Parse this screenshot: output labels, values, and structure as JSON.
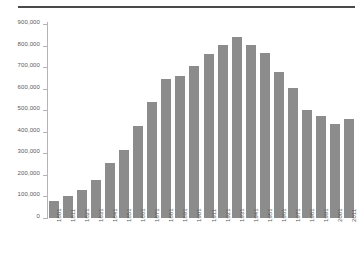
{
  "chart_data": {
    "type": "bar",
    "title": "",
    "subtitle": "",
    "xlabel": "",
    "ylabel": "",
    "grid": false,
    "legend": "none",
    "ylim": [
      0,
      900000
    ],
    "ytick_labels": [
      "900,000",
      "800,000",
      "700,000",
      "600,000",
      "500,000",
      "400,000",
      "300,000",
      "200,000",
      "100,000",
      "0"
    ],
    "ytick_values": [
      900000,
      800000,
      700000,
      600000,
      500000,
      400000,
      300000,
      200000,
      100000,
      0
    ],
    "categories": [
      "1801",
      "1811",
      "1821",
      "1831",
      "1841",
      "1851",
      "1861",
      "1871",
      "1881",
      "1891",
      "1901",
      "1911",
      "1921",
      "1931",
      "1941",
      "1951",
      "1961",
      "1971",
      "1981",
      "1991",
      "2001",
      "2011"
    ],
    "values": [
      80000,
      100000,
      130000,
      178000,
      254000,
      317000,
      427000,
      537000,
      645000,
      660000,
      706000,
      762000,
      801000,
      842000,
      801000,
      766000,
      678000,
      604000,
      500000,
      475000,
      435000,
      460000
    ],
    "series": [
      {
        "name": "Population",
        "values": [
          80000,
          100000,
          130000,
          178000,
          254000,
          317000,
          427000,
          537000,
          645000,
          660000,
          706000,
          762000,
          801000,
          842000,
          801000,
          766000,
          678000,
          604000,
          500000,
          475000,
          435000,
          460000
        ]
      }
    ],
    "colors": {
      "bar": "#8c8c8c",
      "axis": "#b4b4b4",
      "rule": "#4a4a4a",
      "text": "#5a5a5a",
      "background": "#ffffff"
    }
  }
}
